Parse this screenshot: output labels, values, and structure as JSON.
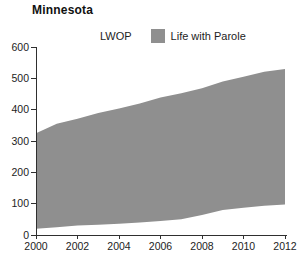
{
  "title": "Minnesota",
  "legend": {
    "items": [
      {
        "label": "LWOP",
        "swatch_color": "#ffffff"
      },
      {
        "label": "Life with Parole",
        "swatch_color": "#8f8f8f"
      }
    ]
  },
  "chart_data": {
    "type": "area",
    "stacked": true,
    "title": "Minnesota",
    "x": [
      2000,
      2001,
      2002,
      2003,
      2004,
      2005,
      2006,
      2007,
      2008,
      2009,
      2010,
      2011,
      2012
    ],
    "series": [
      {
        "name": "LWOP",
        "color": "#ffffff",
        "values": [
          20,
          25,
          30,
          33,
          36,
          40,
          45,
          50,
          64,
          80,
          87,
          93,
          97
        ]
      },
      {
        "name": "Life with Parole",
        "color": "#8f8f8f",
        "values": [
          305,
          330,
          341,
          356,
          368,
          380,
          394,
          402,
          404,
          410,
          418,
          428,
          433
        ]
      }
    ],
    "xlabel": "",
    "ylabel": "",
    "ylim": [
      0,
      600
    ],
    "yticks": [
      0,
      100,
      200,
      300,
      400,
      500,
      600
    ],
    "xticks": [
      2000,
      2002,
      2004,
      2006,
      2008,
      2010,
      2012
    ],
    "legend_position": "top",
    "grid": false
  },
  "colors": {
    "axis": "#2f2f2f",
    "text": "#1d1d1d",
    "area_fill": "#8f8f8f",
    "background": "#ffffff"
  }
}
